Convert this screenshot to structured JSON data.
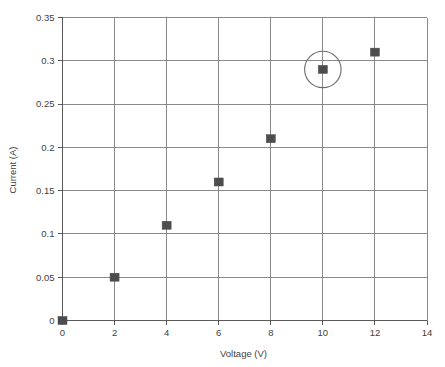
{
  "chart_data": {
    "type": "scatter",
    "title": "",
    "xlabel": "Voltage (V)",
    "ylabel": "Current (A)",
    "x": [
      0,
      2,
      4,
      6,
      8,
      10,
      12
    ],
    "values": [
      0,
      0.05,
      0.11,
      0.16,
      0.21,
      0.29,
      0.31
    ],
    "series": [
      {
        "name": "Current vs Voltage",
        "points": [
          {
            "x": 0,
            "y": 0
          },
          {
            "x": 2,
            "y": 0.05
          },
          {
            "x": 4,
            "y": 0.11
          },
          {
            "x": 6,
            "y": 0.16
          },
          {
            "x": 8,
            "y": 0.21
          },
          {
            "x": 10,
            "y": 0.29
          },
          {
            "x": 12,
            "y": 0.31
          }
        ]
      }
    ],
    "xlim": [
      0,
      14
    ],
    "ylim": [
      0,
      0.35
    ],
    "xticks": [
      "0",
      "2",
      "4",
      "6",
      "8",
      "10",
      "12",
      "14"
    ],
    "xtick_values": [
      0,
      2,
      4,
      6,
      8,
      10,
      12,
      14
    ],
    "yticks": [
      "0",
      "0.05",
      "0.1",
      "0.15",
      "0.2",
      "0.25",
      "0.3",
      "0.35"
    ],
    "ytick_values": [
      0,
      0.05,
      0.1,
      0.15,
      0.2,
      0.25,
      0.3,
      0.35
    ],
    "grid": true,
    "legend": false,
    "legend_position": "none",
    "marker_shape": "square",
    "marker_color": "#4d4d4d",
    "grid_color": "#7d7d7d",
    "axis_color": "#5a5a5a",
    "background_color": "#ffffff",
    "annotations": [
      {
        "type": "circle",
        "name": "highlight-circle",
        "target_point": {
          "x": 10,
          "y": 0.29
        },
        "radius_data_x": 0.7,
        "stroke_color": "#6b6b6b"
      }
    ]
  }
}
